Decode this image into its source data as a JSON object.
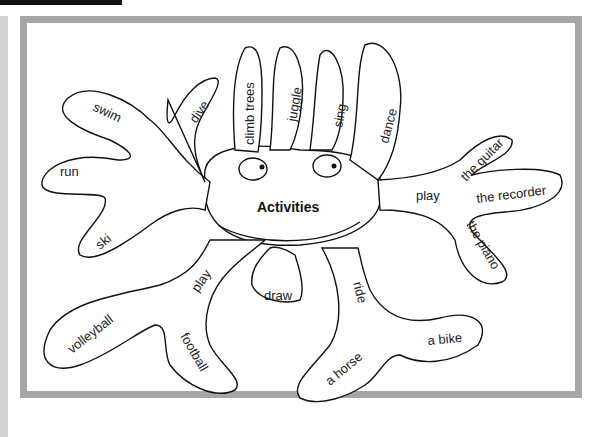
{
  "diagram": {
    "type": "mind-map",
    "center": "Activities",
    "branches": [
      {
        "label": "swim"
      },
      {
        "label": "dive"
      },
      {
        "label": "run"
      },
      {
        "label": "ski"
      },
      {
        "label": "climb trees"
      },
      {
        "label": "juggle"
      },
      {
        "label": "sing"
      },
      {
        "label": "dance"
      },
      {
        "label": "play",
        "children": [
          "the guitar",
          "the recorder",
          "the piano"
        ]
      },
      {
        "label": "play",
        "children": [
          "volleyball",
          "football"
        ]
      },
      {
        "label": "draw"
      },
      {
        "label": "ride",
        "children": [
          "a horse",
          "a bike"
        ]
      }
    ]
  },
  "colors": {
    "frame": "#a6a6a6",
    "stroke": "#111111",
    "topbar": "#111111"
  }
}
